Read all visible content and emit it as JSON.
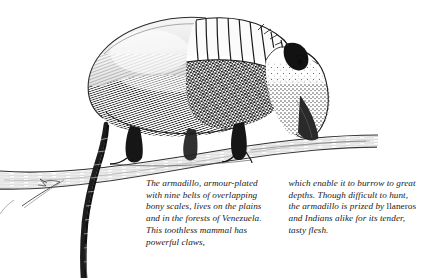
{
  "page": {
    "background_color": "#ffffff",
    "ink_color": "#1a1a1a"
  },
  "illustration": {
    "subject": "armadillo-on-branch",
    "style": "pen-and-ink engraving",
    "parts": [
      {
        "name": "carapace-rear-dome",
        "description": "rounded hatched rear shell"
      },
      {
        "name": "banded-shell",
        "description": "nine overlapping bony bands"
      },
      {
        "name": "head",
        "description": "tapered stippled head with long snout"
      },
      {
        "name": "ear",
        "description": "small dark pointed ear"
      },
      {
        "name": "eye",
        "description": "small dark eye"
      },
      {
        "name": "foreleg",
        "description": "clawed front leg gripping branch"
      },
      {
        "name": "hindleg",
        "description": "clawed rear leg on branch"
      },
      {
        "name": "tail",
        "description": "long tapering scaled tail hanging down"
      },
      {
        "name": "branch",
        "description": "horizontal tree branch with twig"
      }
    ]
  },
  "caption": {
    "columns": [
      {
        "id": "left",
        "segments": [
          {
            "style": "italic",
            "text": "The armadillo, armour-plated with nine belts of overlapping bony scales, lives on the plains and in the forests of Venezuela. This toothless mammal has powerful claws,"
          }
        ]
      },
      {
        "id": "right",
        "segments": [
          {
            "style": "italic",
            "text": "which enable it to burrow to great depths. Though difficult to hunt, the armadillo is prized by "
          },
          {
            "style": "roman",
            "text": "llaneros"
          },
          {
            "style": "italic",
            "text": " and Indians alike for its tender, tasty flesh."
          }
        ]
      }
    ]
  }
}
